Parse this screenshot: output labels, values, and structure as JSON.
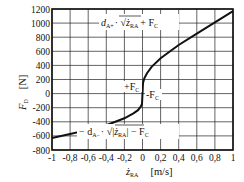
{
  "chart_data": {
    "type": "line",
    "title": "",
    "xlabel": "ż_RA [m/s]",
    "ylabel": "F_D [N]",
    "xlim": [
      -1,
      1
    ],
    "ylim": [
      -800,
      1200
    ],
    "grid": true,
    "x_ticks": [
      "-1",
      "-0,8",
      "-0,6",
      "-0,4",
      "-0,2",
      "0",
      "0,2",
      "0,4",
      "0,6",
      "0,8",
      "1"
    ],
    "y_ticks": [
      "1200",
      "1000",
      "800",
      "600",
      "400",
      "200",
      "0",
      "-200",
      "-400",
      "-600",
      "-800"
    ],
    "series": [
      {
        "name": "F_D",
        "x": [
          -1.0,
          -0.8,
          -0.6,
          -0.4,
          -0.2,
          -0.1,
          -0.05,
          -0.02,
          -0.005,
          0,
          0.005,
          0.02,
          0.05,
          0.1,
          0.2,
          0.4,
          0.6,
          0.8,
          1.0
        ],
        "y": [
          -630,
          -575,
          -515,
          -450,
          -350,
          -280,
          -235,
          -185,
          -150,
          0,
          150,
          215,
          290,
          380,
          500,
          690,
          850,
          1010,
          1170
        ]
      }
    ],
    "annotations": {
      "upper_formula": "d_A+ · √ż_RA + F_C",
      "lower_formula": "− d_A− · √|ż_RA| − F_C",
      "plus_fc": "+F_C",
      "minus_fc": "-F_C"
    }
  },
  "labels": {
    "ylabel_main": "F",
    "ylabel_sub": "D",
    "yunit": "[N]",
    "xlabel_main": "ż",
    "xlabel_sub": "RA",
    "xunit": "[m/s]",
    "upper_d": "d",
    "upper_d_sub": "A+",
    "upper_rest": "· √",
    "upper_z": "ż",
    "upper_z_sub": "RA",
    "upper_plus": "+ F",
    "upper_plus_sub": "C",
    "lower_minus": "− d",
    "lower_d_sub": "A−",
    "lower_rest": "· √|",
    "lower_z": "ż",
    "lower_z_sub": "RA",
    "lower_end": "| − F",
    "lower_end_sub": "C",
    "plus_fc": "+F",
    "plus_fc_sub": "C",
    "minus_fc": "-F",
    "minus_fc_sub": "C"
  }
}
